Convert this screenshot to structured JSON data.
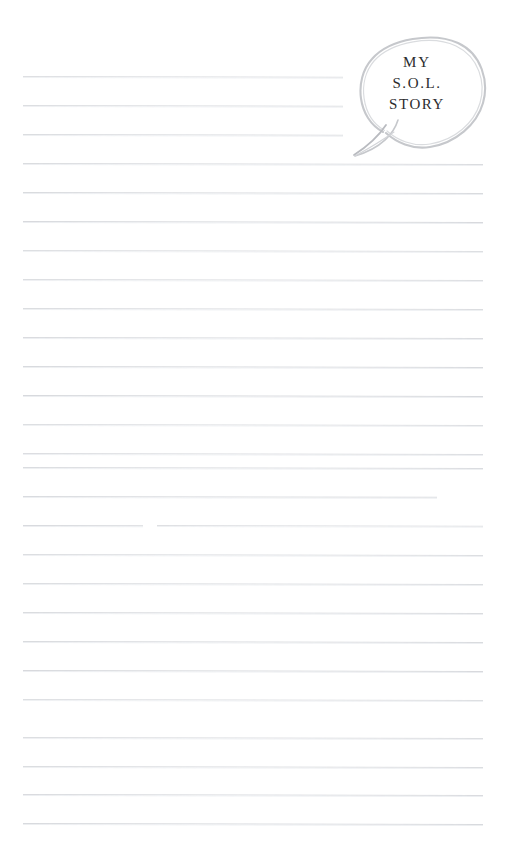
{
  "page": {
    "kind": "lined-worksheet-page",
    "width": 506,
    "height": 856,
    "background_color": "#ffffff"
  },
  "bubble": {
    "shape": "hand-drawn-oval-speech-bubble",
    "outline_color": "#c9cbcf",
    "fill_color": "#ffffff",
    "text_color": "#2b2b2d",
    "lines": [
      "MY",
      "S.O.L.",
      "STORY"
    ],
    "full_text": "MY S.O.L. STORY"
  },
  "ruled_lines": {
    "color": "#d6d8dc",
    "count": 27,
    "spacing_px": 29,
    "left_px": 23,
    "right_px": 483,
    "items": [
      {
        "y": 76,
        "left": 23,
        "right": 343
      },
      {
        "y": 105,
        "left": 23,
        "right": 343
      },
      {
        "y": 134,
        "left": 23,
        "right": 343
      },
      {
        "y": 163,
        "left": 23,
        "right": 483
      },
      {
        "y": 192,
        "left": 23,
        "right": 483
      },
      {
        "y": 221,
        "left": 23,
        "right": 483
      },
      {
        "y": 250,
        "left": 23,
        "right": 483
      },
      {
        "y": 279,
        "left": 23,
        "right": 483
      },
      {
        "y": 308,
        "left": 23,
        "right": 483
      },
      {
        "y": 337,
        "left": 23,
        "right": 483
      },
      {
        "y": 366,
        "left": 23,
        "right": 483
      },
      {
        "y": 395,
        "left": 23,
        "right": 483
      },
      {
        "y": 424,
        "left": 23,
        "right": 483
      },
      {
        "y": 453,
        "left": 23,
        "right": 483
      },
      {
        "y": 467,
        "left": 23,
        "right": 483
      },
      {
        "y": 496,
        "left": 23,
        "right": 437
      },
      {
        "y": 525,
        "left": 23,
        "right": 143
      },
      {
        "y": 525,
        "left": 157,
        "right": 483
      },
      {
        "y": 554,
        "left": 23,
        "right": 483
      },
      {
        "y": 583,
        "left": 23,
        "right": 483
      },
      {
        "y": 612,
        "left": 23,
        "right": 483
      },
      {
        "y": 641,
        "left": 23,
        "right": 483
      },
      {
        "y": 670,
        "left": 23,
        "right": 483
      },
      {
        "y": 699,
        "left": 23,
        "right": 483
      },
      {
        "y": 737,
        "left": 23,
        "right": 483
      },
      {
        "y": 766,
        "left": 23,
        "right": 483
      },
      {
        "y": 794,
        "left": 23,
        "right": 483
      },
      {
        "y": 823,
        "left": 23,
        "right": 483
      }
    ]
  }
}
